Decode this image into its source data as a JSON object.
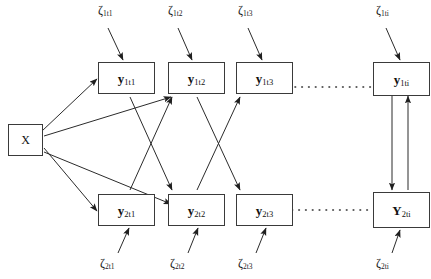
{
  "figure": {
    "type": "path-diagram"
  },
  "nodes": {
    "predictor": {
      "id": "X",
      "label": "X"
    },
    "row1": [
      {
        "id": "y1t1",
        "letter": "y",
        "sub": "1t1"
      },
      {
        "id": "y1t2",
        "letter": "y",
        "sub": "1t2"
      },
      {
        "id": "y1t3",
        "letter": "y",
        "sub": "1t3"
      },
      {
        "id": "y1ti",
        "letter": "y",
        "sub": "1ti"
      }
    ],
    "row2": [
      {
        "id": "y2t1",
        "letter": "y",
        "sub": "2t1"
      },
      {
        "id": "y2t2",
        "letter": "y",
        "sub": "2t2"
      },
      {
        "id": "y2t3",
        "letter": "y",
        "sub": "2t3"
      },
      {
        "id": "Y2ti",
        "letter": "Y",
        "sub": "2ti"
      }
    ]
  },
  "disturbances": {
    "top": [
      {
        "id": "z1t1",
        "letter": "ζ",
        "sub": "1t1"
      },
      {
        "id": "z1t2",
        "letter": "ζ",
        "sub": "1t2"
      },
      {
        "id": "z1t3",
        "letter": "ζ",
        "sub": "1t3"
      },
      {
        "id": "z1ti",
        "letter": "ζ",
        "sub": "1ti"
      }
    ],
    "bottom": [
      {
        "id": "z2t1",
        "letter": "ζ",
        "sub": "2t1"
      },
      {
        "id": "z2t2",
        "letter": "ζ",
        "sub": "2t2"
      },
      {
        "id": "z2t3",
        "letter": "ζ",
        "sub": "2t3"
      },
      {
        "id": "z2ti",
        "letter": "ζ",
        "sub": "2ti"
      }
    ]
  },
  "ellipsis": {
    "glyph": "·",
    "top_label": "dotted-continuation-top",
    "bottom_label": "dotted-continuation-bottom"
  },
  "colors": {
    "stroke": "#2b2b2b",
    "box_border": "#3a3a3a",
    "background": "#ffffff",
    "text": "#111111"
  }
}
